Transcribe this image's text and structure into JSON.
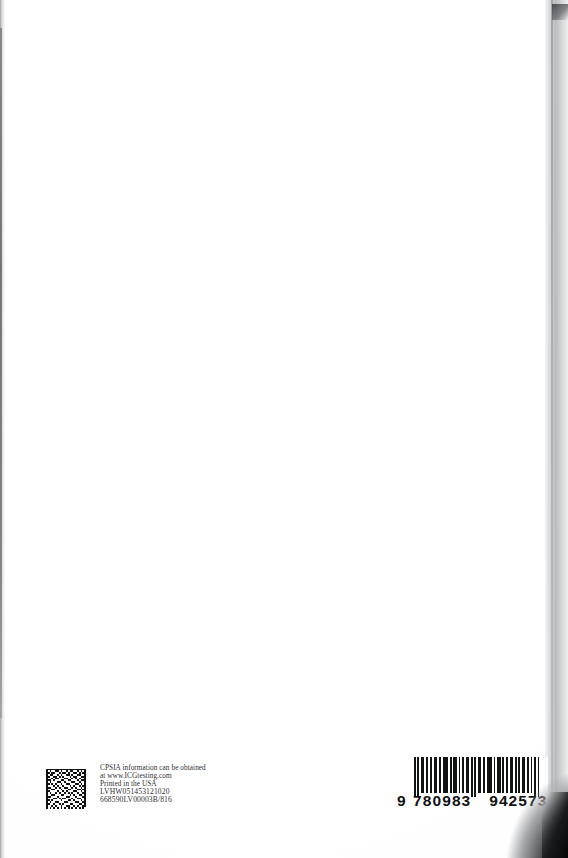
{
  "page": {
    "kind": "book-back-cover-scan",
    "width": 568,
    "height": 858,
    "background_color": "#ffffff",
    "text_color": "#2f3033",
    "edge_shadow_color": "#8d8f92",
    "corner_shadow_color": "#0b0b0c"
  },
  "imprint": {
    "lines": [
      "CPSIA information can be obtained",
      "at www.ICGtesting.com",
      "Printed in the USA"
    ],
    "codes": [
      "LVHW051453121020",
      "668590LV00003B/816"
    ]
  },
  "datamatrix": {
    "label": "2D data matrix code",
    "module_count": 22,
    "foreground_color": "#111214",
    "background_color": "#ffffff"
  },
  "barcode": {
    "symbology": "EAN-13",
    "lead_digit": "9",
    "group_left": "780983",
    "group_right": "942573",
    "full_number": "9 780983 942573",
    "bar_color": "#111214",
    "digits_color": "#111214"
  }
}
